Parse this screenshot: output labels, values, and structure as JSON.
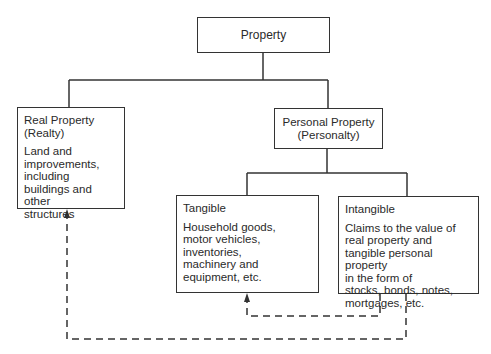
{
  "diagram": {
    "type": "hierarchy",
    "nodes": {
      "property": {
        "title": "Property"
      },
      "real_property": {
        "title": "Real Property\n     (Realty)",
        "description": "Land and\nimprovements,\nincluding\nbuildings and other\nstructures"
      },
      "personal_property": {
        "title": "Personal Property\n(Personalty)"
      },
      "tangible": {
        "title": "Tangible",
        "description": "Household goods,\nmotor vehicles,\ninventories,\nmachinery and\nequipment, etc."
      },
      "intangible": {
        "title": "Intangible",
        "description": "Claims to the value of\nreal property and\ntangible personal property\nin the form of\nstocks, bonds, notes,\nmortgages, etc."
      }
    },
    "edges": [
      {
        "from": "Property",
        "to": "Real Property (Realty)",
        "style": "solid"
      },
      {
        "from": "Property",
        "to": "Personal Property (Personalty)",
        "style": "solid"
      },
      {
        "from": "Personal Property (Personalty)",
        "to": "Tangible",
        "style": "solid"
      },
      {
        "from": "Personal Property (Personalty)",
        "to": "Intangible",
        "style": "solid"
      },
      {
        "from": "Intangible",
        "to": "Tangible",
        "style": "dashed-arrow"
      },
      {
        "from": "Intangible",
        "to": "Real Property (Realty)",
        "style": "dashed-arrow"
      }
    ],
    "colors": {
      "line": "#333333",
      "text": "#2a2a2a",
      "background": "#ffffff"
    }
  }
}
